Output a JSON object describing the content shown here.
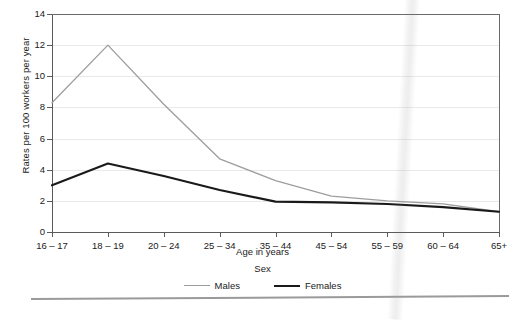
{
  "chart_data": {
    "type": "line",
    "title": "",
    "xlabel": "Age in years",
    "ylabel": "Rates per 100 workers per year",
    "categories": [
      "16 – 17",
      "18 – 19",
      "20 – 24",
      "25 – 34",
      "35 – 44",
      "45 – 54",
      "55 – 59",
      "60 – 64",
      "65+"
    ],
    "ylim": [
      0,
      14
    ],
    "yticks": [
      0,
      2,
      4,
      6,
      8,
      10,
      12,
      14
    ],
    "ytick_labels": [
      "0",
      "2",
      "4",
      "6",
      "8",
      "10",
      "12",
      "14"
    ],
    "grid": true,
    "grid_axis": "y",
    "legend_position": "below-plot",
    "legend_title": "Sex",
    "series": [
      {
        "name": "Males",
        "color": "#9d9d9d",
        "line_width": 1.3,
        "values": [
          8.3,
          12.0,
          8.2,
          4.7,
          3.3,
          2.3,
          2.0,
          1.8,
          1.3
        ]
      },
      {
        "name": "Females",
        "color": "#1a1a1a",
        "line_width": 2.1,
        "values": [
          3.0,
          4.4,
          3.6,
          2.7,
          1.95,
          1.9,
          1.8,
          1.6,
          1.3
        ]
      }
    ]
  },
  "legend": {
    "title": "Sex",
    "entries": [
      {
        "label": "Males",
        "swatch": "gray-line-swatch"
      },
      {
        "label": "Females",
        "swatch": "black-line-swatch"
      }
    ]
  },
  "colors": {
    "males": "#9d9d9d",
    "females": "#1a1a1a",
    "axis": "#5a5a5a",
    "grid": "#e9e9e9",
    "background": "#ffffff"
  }
}
